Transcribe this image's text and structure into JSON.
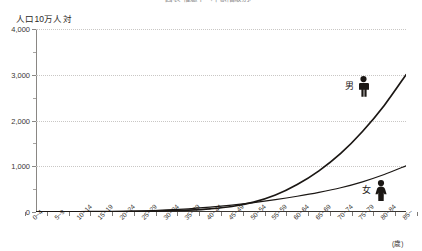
{
  "chart_data": {
    "type": "line",
    "title": "図表 罹患率（年齢階級別）",
    "ylabel": "人口10万人対",
    "xlabel": "(歳)",
    "ylim": [
      0,
      4000
    ],
    "ytick_labels": [
      "4,000",
      "3,000",
      "2,000",
      "1,000",
      "0"
    ],
    "ytick_values": [
      4000,
      3000,
      2000,
      1000,
      0
    ],
    "yminor_values": [
      3500,
      2500,
      1500,
      500
    ],
    "grid": true,
    "grid_style": "dotted",
    "legend_position": "inline-right",
    "categories": [
      "0~4",
      "5~9",
      "10~14",
      "15~19",
      "20~24",
      "25~29",
      "30~34",
      "35~39",
      "40~44",
      "45~49",
      "50~54",
      "55~59",
      "60~64",
      "65~69",
      "70~74",
      "75~79",
      "80~84",
      "85~"
    ],
    "series": [
      {
        "name": "男",
        "icon": "male-pictogram",
        "color": "#1b1714",
        "values": [
          3,
          5,
          6,
          8,
          11,
          16,
          26,
          42,
          70,
          120,
          215,
          370,
          600,
          900,
          1280,
          1760,
          2330,
          3000
        ]
      },
      {
        "name": "女",
        "icon": "female-pictogram",
        "color": "#1b1714",
        "values": [
          3,
          4,
          5,
          8,
          14,
          26,
          45,
          70,
          105,
          150,
          205,
          270,
          345,
          430,
          530,
          660,
          820,
          1010
        ]
      }
    ]
  },
  "annotations": {
    "male": {
      "label": "男"
    },
    "female": {
      "label": "女"
    }
  }
}
